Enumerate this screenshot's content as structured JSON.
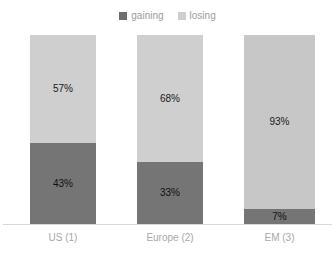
{
  "legend": {
    "position": "top-center",
    "entries": [
      {
        "label": "gaining",
        "color": "#6e6e6e",
        "swatch_icon": "square-swatch-icon"
      },
      {
        "label": "losing",
        "color": "#cfcfcf",
        "swatch_icon": "square-swatch-icon"
      }
    ]
  },
  "axis": {
    "baseline_visible": true,
    "baseline_color": "#d8d8d8"
  },
  "bars": [
    {
      "category": "US (1)",
      "left": 30,
      "width": 66,
      "segments": [
        {
          "series": "losing",
          "label": "57%",
          "value": 57,
          "color": "#cfcfcf"
        },
        {
          "series": "gaining",
          "label": "43%",
          "value": 43,
          "color": "#757575"
        }
      ]
    },
    {
      "category": "Europe (2)",
      "left": 137,
      "width": 66,
      "segments": [
        {
          "series": "losing",
          "label": "68%",
          "value": 67,
          "color": "#cfcfcf"
        },
        {
          "series": "gaining",
          "label": "33%",
          "value": 33,
          "color": "#757575"
        }
      ]
    },
    {
      "category": "EM (3)",
      "left": 244,
      "width": 71,
      "segments": [
        {
          "series": "losing",
          "label": "93%",
          "value": 92,
          "color": "#c7c7c7"
        },
        {
          "series": "gaining",
          "label": "7%",
          "value": 8,
          "color": "#757575"
        }
      ]
    }
  ],
  "chart_data": {
    "type": "bar",
    "subtype": "stacked-column-100",
    "title": "",
    "subtitle": "",
    "xlabel": "",
    "ylabel": "",
    "ylim": [
      0,
      100
    ],
    "grid": false,
    "legend_position": "top-center",
    "categories": [
      "US (1)",
      "Europe (2)",
      "EM (3)"
    ],
    "series": [
      {
        "name": "gaining",
        "color": "#6e6e6e",
        "values": [
          43,
          33,
          7
        ],
        "value_labels": [
          "43%",
          "33%",
          "7%"
        ]
      },
      {
        "name": "losing",
        "color": "#cfcfcf",
        "values": [
          57,
          68,
          93
        ],
        "value_labels": [
          "57%",
          "68%",
          "93%"
        ]
      }
    ],
    "stack_order_top_to_bottom": [
      "losing",
      "gaining"
    ],
    "tick_labels": {
      "x": [
        "US (1)",
        "Europe (2)",
        "EM (3)"
      ],
      "y": []
    },
    "annotations": []
  }
}
